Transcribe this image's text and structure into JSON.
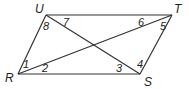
{
  "figure": {
    "type": "parallelogram with diagonals",
    "vertices": {
      "U": {
        "label": "U",
        "x": 46,
        "y": 15
      },
      "T": {
        "label": "T",
        "x": 172,
        "y": 15
      },
      "S": {
        "label": "S",
        "x": 140,
        "y": 74
      },
      "R": {
        "label": "R",
        "x": 18,
        "y": 74
      }
    },
    "angles": [
      {
        "label": "1",
        "vertex": "R"
      },
      {
        "label": "2",
        "vertex": "R"
      },
      {
        "label": "3",
        "vertex": "S"
      },
      {
        "label": "4",
        "vertex": "S"
      },
      {
        "label": "5",
        "vertex": "T"
      },
      {
        "label": "6",
        "vertex": "T"
      },
      {
        "label": "7",
        "vertex": "U"
      },
      {
        "label": "8",
        "vertex": "U"
      }
    ],
    "line_color": "#333333"
  }
}
